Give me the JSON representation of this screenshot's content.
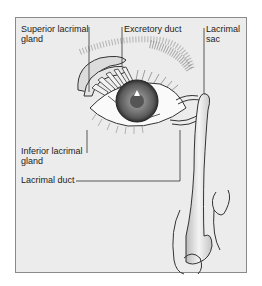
{
  "diagram": {
    "labels": {
      "superior_gland_line1": "Superior lacrimal",
      "superior_gland_line2": "gland",
      "excretory_duct": "Excretory duct",
      "lacrimal_sac_line1": "Lacrimal",
      "lacrimal_sac_line2": "sac",
      "inferior_gland_line1": "Inferior lacrimal",
      "inferior_gland_line2": "gland",
      "lacrimal_duct": "Lacrimal duct"
    },
    "colors": {
      "background": "#ececec",
      "frame_border": "#8a8a8a",
      "line": "#333333",
      "iris": "#6a6a6a",
      "gland_fill": "#dcdcdc"
    }
  }
}
